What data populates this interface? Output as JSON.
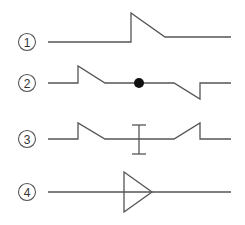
{
  "diagram": {
    "type": "line-symbols",
    "rows": [
      {
        "label": "1",
        "symbol": "single-ramp-step-up"
      },
      {
        "label": "2",
        "symbol": "ramp-dot-ramp-down"
      },
      {
        "label": "3",
        "symbol": "ramp-ibeam-ramp-up"
      },
      {
        "label": "4",
        "symbol": "triangle-arrow"
      }
    ],
    "colors": {
      "line": "#555555",
      "dot": "#111111"
    }
  }
}
